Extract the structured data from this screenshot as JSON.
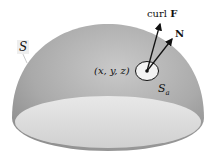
{
  "diagram": {
    "surface_label": "S",
    "point_label": "(x, y, z)",
    "disk_label_main": "S",
    "disk_label_sub": "a",
    "vectors": [
      {
        "label_prefix": "curl ",
        "label_bold": "F"
      },
      {
        "label_bold": "N"
      }
    ],
    "colors": {
      "dome_dark": "#8c8c8c",
      "dome_light": "#c4c4c4",
      "base_light": "#e6e6e6",
      "disk": "#f2f2f2",
      "arrow": "#111111"
    }
  }
}
